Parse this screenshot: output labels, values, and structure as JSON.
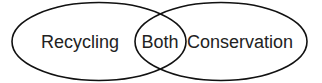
{
  "diagram": {
    "type": "venn",
    "sets": [
      {
        "label": "Recycling"
      },
      {
        "label": "Conservation"
      }
    ],
    "intersection": {
      "label": "Both"
    },
    "stroke_color": "#111111"
  }
}
